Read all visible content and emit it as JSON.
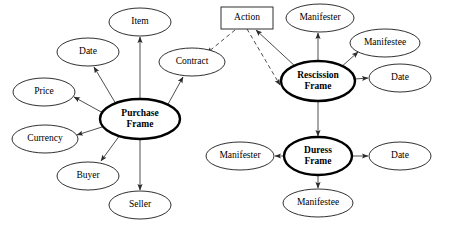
{
  "diagram": {
    "type": "node-link-diagram",
    "colors": {
      "background": "#ffffff",
      "node_stroke": "#1a1a1a",
      "frame_stroke": "#000000",
      "edge": "#3a3a3a",
      "text": "#000000"
    },
    "nodes": [
      {
        "id": "item",
        "label": "Item",
        "shape": "ellipse",
        "role": "attribute",
        "cx": 140,
        "cy": 22,
        "rx": 31,
        "ry": 14
      },
      {
        "id": "date_purchase",
        "label": "Date",
        "shape": "ellipse",
        "role": "attribute",
        "cx": 88,
        "cy": 52,
        "rx": 31,
        "ry": 14
      },
      {
        "id": "price",
        "label": "Price",
        "shape": "ellipse",
        "role": "attribute",
        "cx": 44,
        "cy": 92,
        "rx": 31,
        "ry": 14
      },
      {
        "id": "currency",
        "label": "Currency",
        "shape": "ellipse",
        "role": "attribute",
        "cx": 45,
        "cy": 139,
        "rx": 33,
        "ry": 14
      },
      {
        "id": "buyer",
        "label": "Buyer",
        "shape": "ellipse",
        "role": "attribute",
        "cx": 88,
        "cy": 176,
        "rx": 31,
        "ry": 14
      },
      {
        "id": "seller",
        "label": "Seller",
        "shape": "ellipse",
        "role": "attribute",
        "cx": 140,
        "cy": 205,
        "rx": 31,
        "ry": 14
      },
      {
        "id": "contract",
        "label": "Contract",
        "shape": "ellipse",
        "role": "attribute",
        "cx": 192,
        "cy": 62,
        "rx": 33,
        "ry": 14
      },
      {
        "id": "purchase_frame",
        "label": "Purchase Frame",
        "shape": "ellipse",
        "role": "frame",
        "cx": 140,
        "cy": 119,
        "rx": 40,
        "ry": 20
      },
      {
        "id": "action",
        "label": "Action",
        "shape": "rect",
        "role": "action",
        "cx": 247,
        "cy": 18,
        "rx": 26,
        "ry": 11
      },
      {
        "id": "manifester_resc",
        "label": "Manifester",
        "shape": "ellipse",
        "role": "attribute",
        "cx": 320,
        "cy": 18,
        "rx": 34,
        "ry": 14
      },
      {
        "id": "manifestee_resc",
        "label": "Manifestee",
        "shape": "ellipse",
        "role": "attribute",
        "cx": 385,
        "cy": 43,
        "rx": 35,
        "ry": 14
      },
      {
        "id": "date_resc",
        "label": "Date",
        "shape": "ellipse",
        "role": "attribute",
        "cx": 400,
        "cy": 78,
        "rx": 31,
        "ry": 14
      },
      {
        "id": "rescission_frame",
        "label": "Rescission Frame",
        "shape": "ellipse",
        "role": "frame",
        "cx": 318,
        "cy": 81,
        "rx": 37,
        "ry": 20
      },
      {
        "id": "manifester_duress",
        "label": "Manifester",
        "shape": "ellipse",
        "role": "attribute",
        "cx": 240,
        "cy": 156,
        "rx": 34,
        "ry": 14
      },
      {
        "id": "date_duress",
        "label": "Date",
        "shape": "ellipse",
        "role": "attribute",
        "cx": 400,
        "cy": 156,
        "rx": 31,
        "ry": 14
      },
      {
        "id": "manifestee_duress",
        "label": "Manifestee",
        "shape": "ellipse",
        "role": "attribute",
        "cx": 318,
        "cy": 203,
        "rx": 35,
        "ry": 14
      },
      {
        "id": "duress_frame",
        "label": "Duress Frame",
        "shape": "ellipse",
        "role": "frame",
        "cx": 318,
        "cy": 156,
        "rx": 34,
        "ry": 19
      }
    ],
    "edges": [
      {
        "from": "purchase_frame",
        "to": "item",
        "style": "solid",
        "x1": 140,
        "y1": 99,
        "x2": 140,
        "y2": 37
      },
      {
        "from": "purchase_frame",
        "to": "date_purchase",
        "style": "solid",
        "x1": 116,
        "y1": 104,
        "x2": 94,
        "y2": 67
      },
      {
        "from": "purchase_frame",
        "to": "price",
        "style": "solid",
        "x1": 103,
        "y1": 113,
        "x2": 74,
        "y2": 97
      },
      {
        "from": "purchase_frame",
        "to": "currency",
        "style": "solid",
        "x1": 102,
        "y1": 127,
        "x2": 77,
        "y2": 135
      },
      {
        "from": "purchase_frame",
        "to": "buyer",
        "style": "solid",
        "x1": 120,
        "y1": 135,
        "x2": 101,
        "y2": 161
      },
      {
        "from": "purchase_frame",
        "to": "seller",
        "style": "solid",
        "x1": 140,
        "y1": 139,
        "x2": 140,
        "y2": 190
      },
      {
        "from": "purchase_frame",
        "to": "contract",
        "style": "solid",
        "x1": 167,
        "y1": 106,
        "x2": 183,
        "y2": 77
      },
      {
        "from": "action",
        "to": "contract",
        "style": "dashed",
        "x1": 235,
        "y1": 30,
        "x2": 207,
        "y2": 53
      },
      {
        "from": "action",
        "to": "rescission_frame",
        "style": "dashed",
        "x1": 247,
        "y1": 29,
        "x2": 280,
        "y2": 85
      },
      {
        "from": "rescission_frame",
        "to": "action",
        "style": "solid",
        "x1": 296,
        "y1": 67,
        "x2": 256,
        "y2": 30
      },
      {
        "from": "rescission_frame",
        "to": "manifester_resc",
        "style": "solid",
        "x1": 318,
        "y1": 61,
        "x2": 318,
        "y2": 33
      },
      {
        "from": "rescission_frame",
        "to": "manifestee_resc",
        "style": "solid",
        "x1": 340,
        "y1": 68,
        "x2": 358,
        "y2": 52
      },
      {
        "from": "rescission_frame",
        "to": "date_resc",
        "style": "solid",
        "x1": 355,
        "y1": 79,
        "x2": 368,
        "y2": 78
      },
      {
        "from": "rescission_frame",
        "to": "duress_frame",
        "style": "solid",
        "x1": 318,
        "y1": 101,
        "x2": 318,
        "y2": 136
      },
      {
        "from": "duress_frame",
        "to": "manifester_duress",
        "style": "solid",
        "x1": 284,
        "y1": 156,
        "x2": 275,
        "y2": 156
      },
      {
        "from": "duress_frame",
        "to": "date_duress",
        "style": "solid",
        "x1": 352,
        "y1": 156,
        "x2": 368,
        "y2": 156
      },
      {
        "from": "duress_frame",
        "to": "manifestee_duress",
        "style": "solid",
        "x1": 318,
        "y1": 175,
        "x2": 318,
        "y2": 188
      }
    ]
  }
}
